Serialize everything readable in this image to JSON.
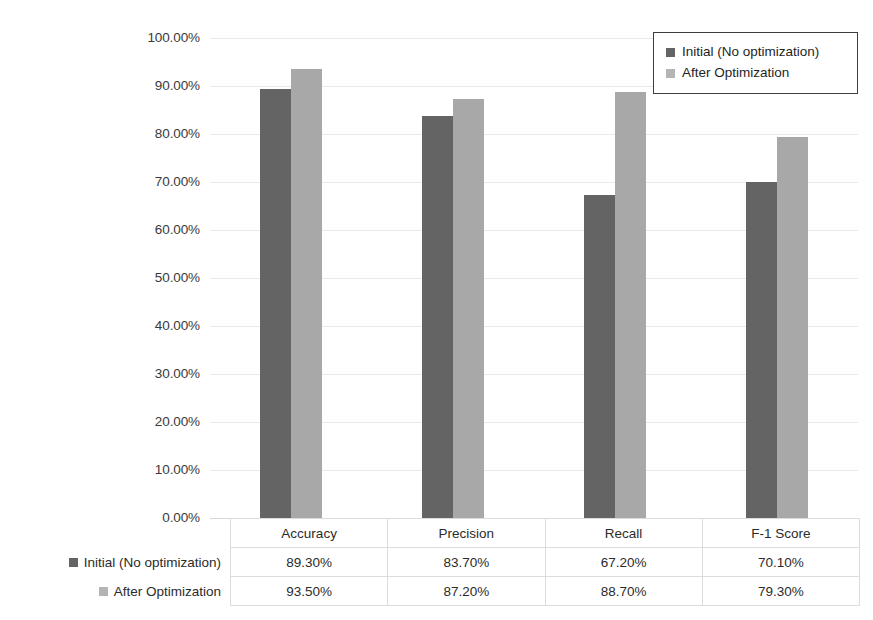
{
  "chart_data": {
    "type": "bar",
    "title": "",
    "xlabel": "",
    "ylabel": "",
    "categories": [
      "Accuracy",
      "Precision",
      "Recall",
      "F-1 Score"
    ],
    "series": [
      {
        "name": "Initial (No optimization)",
        "color": "#646464",
        "values": [
          89.3,
          83.7,
          67.2,
          70.1
        ],
        "labels": [
          "89.30%",
          "83.70%",
          "67.20%",
          "70.10%"
        ]
      },
      {
        "name": "After Optimization",
        "color": "#a8a8a8",
        "values": [
          93.5,
          87.2,
          88.7,
          79.3
        ],
        "labels": [
          "93.50%",
          "87.20%",
          "88.70%",
          "79.30%"
        ]
      }
    ],
    "ylim": [
      0,
      100
    ],
    "ytick_values": [
      0,
      10,
      20,
      30,
      40,
      50,
      60,
      70,
      80,
      90,
      100
    ],
    "ytick_labels": [
      "0.00%",
      "10.00%",
      "20.00%",
      "30.00%",
      "40.00%",
      "50.00%",
      "60.00%",
      "70.00%",
      "80.00%",
      "90.00%",
      "100.00%"
    ],
    "grid": true,
    "legend_position": "top-right",
    "data_table_visible": true
  },
  "legend": {
    "items": [
      {
        "label": "Initial (No optimization)",
        "color": "#646464"
      },
      {
        "label": "After Optimization",
        "color": "#b4b4b4"
      }
    ]
  },
  "table": {
    "column_headers": [
      "Accuracy",
      "Precision",
      "Recall",
      "F-1 Score"
    ],
    "rows": [
      {
        "name": "Initial (No optimization)",
        "color": "#646464",
        "cells": [
          "89.30%",
          "83.70%",
          "67.20%",
          "70.10%"
        ]
      },
      {
        "name": "After Optimization",
        "color": "#b4b4b4",
        "cells": [
          "93.50%",
          "87.20%",
          "88.70%",
          "79.30%"
        ]
      }
    ]
  }
}
